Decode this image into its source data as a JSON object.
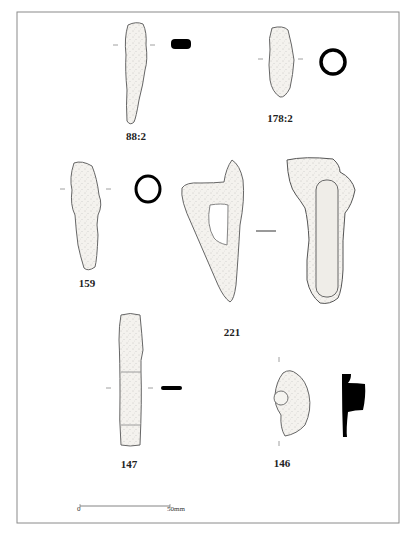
{
  "figure": {
    "type": "archaeological finds illustration plate",
    "colors": {
      "frame": "#8a8a8a",
      "artifact_fill": "#f3f1ec",
      "artifact_stroke": "#555555",
      "section_fill": "#000000"
    },
    "artifacts": [
      {
        "id": "a-88-2",
        "label": "88:2",
        "section": "rectangular-solid"
      },
      {
        "id": "a-178-2",
        "label": "178:2",
        "section": "ring"
      },
      {
        "id": "a-159",
        "label": "159",
        "section": "ring"
      },
      {
        "id": "a-221",
        "label": "221",
        "section": "line"
      },
      {
        "id": "a-147",
        "label": "147",
        "section": "bar-solid"
      },
      {
        "id": "a-146",
        "label": "146",
        "section": "profile-solid"
      }
    ],
    "scale_bar": {
      "start_label": "0",
      "end_label": "50mm"
    }
  }
}
